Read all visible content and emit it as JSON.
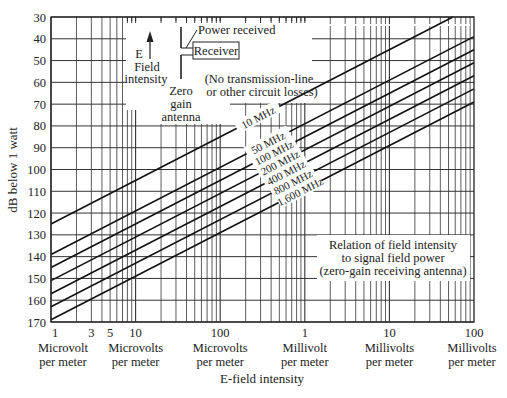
{
  "chart_data": {
    "type": "line",
    "title": "Relation of field intensity to signal field power (zero-gain receiving antenna)",
    "title_lines": [
      "Relation of field intensity",
      "to signal field power",
      "(zero-gain receiving antenna)"
    ],
    "xlabel": "E-field intensity",
    "ylabel": "dB below 1 watt",
    "x_scale": "log",
    "x_unit": "microvolts per meter",
    "xlim": [
      1,
      100000
    ],
    "ylim": [
      30,
      170
    ],
    "y_inverted": true,
    "y_ticks": [
      30,
      40,
      50,
      60,
      70,
      80,
      90,
      100,
      110,
      120,
      130,
      140,
      150,
      160,
      170
    ],
    "x_ticks": [
      {
        "value": 1,
        "label": "1",
        "unit": [
          "Microvolt",
          "per meter"
        ]
      },
      {
        "value": 3,
        "label": "3",
        "unit": []
      },
      {
        "value": 5,
        "label": "5",
        "unit": []
      },
      {
        "value": 10,
        "label": "10",
        "unit": [
          "Microvolts",
          "per meter"
        ]
      },
      {
        "value": 100,
        "label": "100",
        "unit": [
          "Microvolts",
          "per meter"
        ]
      },
      {
        "value": 1000,
        "label": "1",
        "unit": [
          "Millivolt",
          "per meter"
        ]
      },
      {
        "value": 10000,
        "label": "10",
        "unit": [
          "Millivolts",
          "per meter"
        ]
      },
      {
        "value": 100000,
        "label": "100",
        "unit": [
          "Millivolts",
          "per meter"
        ]
      }
    ],
    "grid": true,
    "series": [
      {
        "name": "10 MHz",
        "x": [
          1,
          100000
        ],
        "y": [
          125,
          25
        ]
      },
      {
        "name": "50 MHz",
        "x": [
          1,
          100000
        ],
        "y": [
          139,
          39
        ]
      },
      {
        "name": "100 MHz",
        "x": [
          1,
          100000
        ],
        "y": [
          145,
          45
        ]
      },
      {
        "name": "200 MHz",
        "x": [
          1,
          100000
        ],
        "y": [
          151,
          51
        ]
      },
      {
        "name": "400 MHz",
        "x": [
          1,
          100000
        ],
        "y": [
          157,
          57
        ]
      },
      {
        "name": "800 MHz",
        "x": [
          1,
          100000
        ],
        "y": [
          163,
          63
        ]
      },
      {
        "name": "1,600 MHz",
        "x": [
          1,
          100000
        ],
        "y": [
          169,
          69
        ]
      }
    ],
    "annotations": {
      "e_label": "E",
      "field_intensity": [
        "Field",
        "intensity"
      ],
      "zero_gain_antenna": [
        "Zero",
        "gain",
        "antenna"
      ],
      "power_received": "Power received",
      "receiver": "Receiver",
      "no_losses": [
        "(No transmission-line",
        "or other circuit losses)"
      ]
    }
  }
}
